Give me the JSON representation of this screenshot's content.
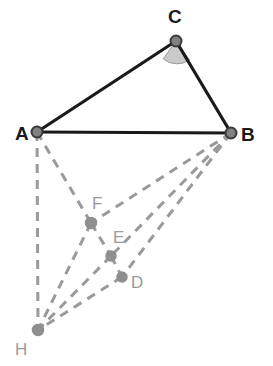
{
  "figure": {
    "background_color": "#ffffff",
    "width": 273,
    "height": 366
  },
  "style": {
    "solid_color": "#1a1a1a",
    "solid_width": 3.2,
    "dashed_color": "#9a9a9a",
    "dashed_width": 3.0,
    "dash_pattern": "9 7",
    "angle_fill": "#b8b8b8",
    "angle_stroke": "#9a9a9a",
    "major_node_fill": "#808080",
    "major_node_stroke": "#3a3a3a",
    "minor_node_fill": "#8f8f8f",
    "minor_node_stroke": "#8f8f8f",
    "major_label_color": "#1a1a1a",
    "minor_label_color": "#9a9a9a"
  },
  "points": {
    "A": {
      "name": "A",
      "x": 37,
      "y": 132,
      "label_x": 15,
      "label_y": 140,
      "kind": "major",
      "radius": 5.5
    },
    "B": {
      "name": "B",
      "x": 231,
      "y": 133,
      "label_x": 241,
      "label_y": 141,
      "kind": "major",
      "radius": 5.5
    },
    "C": {
      "name": "C",
      "x": 176,
      "y": 41,
      "label_x": 168,
      "label_y": 23,
      "kind": "major",
      "radius": 5.5
    },
    "D": {
      "name": "D",
      "x": 122,
      "y": 277,
      "label_x": 131,
      "label_y": 288,
      "kind": "minor",
      "radius": 5.0
    },
    "E": {
      "name": "E",
      "x": 111,
      "y": 256,
      "label_x": 113,
      "label_y": 243,
      "kind": "minor",
      "radius": 5.0
    },
    "F": {
      "name": "F",
      "x": 91,
      "y": 223,
      "label_x": 92,
      "label_y": 209,
      "kind": "minor",
      "radius": 5.5
    },
    "H": {
      "name": "H",
      "x": 38,
      "y": 330,
      "label_x": 15,
      "label_y": 355,
      "kind": "minor",
      "radius": 5.5
    }
  },
  "solid_edges": [
    {
      "name": "edge-AC",
      "from": "A",
      "to": "C"
    },
    {
      "name": "edge-CB",
      "from": "C",
      "to": "B"
    },
    {
      "name": "edge-AB",
      "from": "A",
      "to": "B"
    }
  ],
  "dashed_edges": [
    {
      "name": "edge-AH",
      "from": "A",
      "to": "H"
    },
    {
      "name": "edge-AF",
      "from": "A",
      "to": "F"
    },
    {
      "name": "edge-FH",
      "from": "F",
      "to": "H"
    },
    {
      "name": "edge-EH",
      "from": "E",
      "to": "H"
    },
    {
      "name": "edge-DH",
      "from": "D",
      "to": "H"
    },
    {
      "name": "edge-BF",
      "from": "B",
      "to": "F"
    },
    {
      "name": "edge-BE",
      "from": "B",
      "to": "E"
    },
    {
      "name": "edge-BD",
      "from": "B",
      "to": "D"
    },
    {
      "name": "edge-FE",
      "from": "F",
      "to": "E"
    },
    {
      "name": "edge-ED",
      "from": "E",
      "to": "D"
    }
  ],
  "angle_marker": {
    "name": "angle-at-C",
    "vertex": "C",
    "radius": 22,
    "path": "M 176 41 L 163.2 58.9 A 22 22 0 0 0 189.6 59.9 Z"
  },
  "labels": {
    "A": "A",
    "B": "B",
    "C": "C",
    "D": "D",
    "E": "E",
    "F": "F",
    "H": "H"
  }
}
